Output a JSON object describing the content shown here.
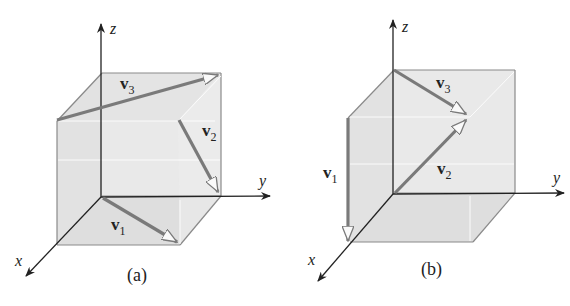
{
  "figure": {
    "panels": [
      {
        "id": "a",
        "caption": "(a)",
        "axes": {
          "x": "x",
          "y": "y",
          "z": "z"
        },
        "vectors": [
          {
            "name": "v",
            "sub": "1",
            "description": "from origin along bottom face diagonal toward front-right bottom corner"
          },
          {
            "name": "v",
            "sub": "2",
            "description": "on back-right area, pointing down toward y-axis end of cube"
          },
          {
            "name": "v",
            "sub": "3",
            "description": "from front-top-left corner to back-top-right corner"
          }
        ]
      },
      {
        "id": "b",
        "caption": "(b)",
        "axes": {
          "x": "x",
          "y": "y",
          "z": "z"
        },
        "vectors": [
          {
            "name": "v",
            "sub": "1",
            "description": "vertical down along front-left edge to x-axis"
          },
          {
            "name": "v",
            "sub": "2",
            "description": "from origin toward center of back face"
          },
          {
            "name": "v",
            "sub": "3",
            "description": "from top of z-axis toward center of back face"
          }
        ]
      }
    ],
    "colors": {
      "cube_fill": "#e6e6e6",
      "cube_edge": "#8a8a8a",
      "vector": "#7a7a7a",
      "axis": "#222222"
    }
  }
}
